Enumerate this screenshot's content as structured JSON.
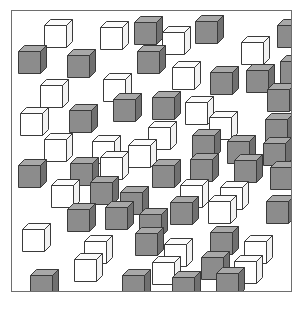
{
  "figure": {
    "title": "",
    "panel": {
      "x": 11,
      "y": 10,
      "width": 281,
      "height": 282,
      "border_color": "#6e6e6e",
      "background_color": "#ffffff"
    },
    "cube_style": {
      "size": 22,
      "depth": 6,
      "outline_color": "#3a3a3a",
      "gray_front": "#8c8c8c",
      "gray_top": "#a8a8a8",
      "gray_side": "#707070",
      "white_front": "#ffffff",
      "white_top": "#fbfbfb",
      "white_side": "#f2f2f2"
    },
    "counts": {
      "total": 61,
      "gray": 32,
      "white": 29
    }
  },
  "chart_data": {
    "type": "scatter",
    "title": "",
    "xlabel": "",
    "ylabel": "",
    "xlim": [
      0,
      281
    ],
    "ylim": [
      0,
      282
    ],
    "grid": false,
    "legend": [
      {
        "name": "gray cube",
        "color": "#8c8c8c"
      },
      {
        "name": "white cube",
        "color": "#ffffff"
      }
    ],
    "series": [
      {
        "name": "cubes",
        "points": [
          {
            "x": 32,
            "y": 8,
            "color": "white"
          },
          {
            "x": 88,
            "y": 10,
            "color": "white"
          },
          {
            "x": 122,
            "y": 5,
            "color": "gray"
          },
          {
            "x": 150,
            "y": 15,
            "color": "white"
          },
          {
            "x": 183,
            "y": 4,
            "color": "gray"
          },
          {
            "x": 229,
            "y": 25,
            "color": "white"
          },
          {
            "x": 265,
            "y": 8,
            "color": "gray"
          },
          {
            "x": 6,
            "y": 34,
            "color": "gray"
          },
          {
            "x": 55,
            "y": 38,
            "color": "gray"
          },
          {
            "x": 125,
            "y": 34,
            "color": "gray"
          },
          {
            "x": 160,
            "y": 50,
            "color": "white"
          },
          {
            "x": 198,
            "y": 55,
            "color": "gray"
          },
          {
            "x": 234,
            "y": 53,
            "color": "gray"
          },
          {
            "x": 268,
            "y": 44,
            "color": "gray"
          },
          {
            "x": 28,
            "y": 68,
            "color": "white"
          },
          {
            "x": 91,
            "y": 62,
            "color": "white"
          },
          {
            "x": 140,
            "y": 80,
            "color": "gray"
          },
          {
            "x": 173,
            "y": 85,
            "color": "white"
          },
          {
            "x": 255,
            "y": 72,
            "color": "gray"
          },
          {
            "x": 8,
            "y": 96,
            "color": "white"
          },
          {
            "x": 57,
            "y": 93,
            "color": "gray"
          },
          {
            "x": 101,
            "y": 82,
            "color": "gray"
          },
          {
            "x": 136,
            "y": 110,
            "color": "white"
          },
          {
            "x": 197,
            "y": 100,
            "color": "white"
          },
          {
            "x": 253,
            "y": 102,
            "color": "gray"
          },
          {
            "x": 32,
            "y": 122,
            "color": "white"
          },
          {
            "x": 80,
            "y": 124,
            "color": "white"
          },
          {
            "x": 116,
            "y": 128,
            "color": "white"
          },
          {
            "x": 180,
            "y": 118,
            "color": "gray"
          },
          {
            "x": 215,
            "y": 124,
            "color": "gray"
          },
          {
            "x": 251,
            "y": 126,
            "color": "gray"
          },
          {
            "x": 6,
            "y": 148,
            "color": "gray"
          },
          {
            "x": 58,
            "y": 146,
            "color": "gray"
          },
          {
            "x": 88,
            "y": 140,
            "color": "white"
          },
          {
            "x": 140,
            "y": 148,
            "color": "gray"
          },
          {
            "x": 178,
            "y": 142,
            "color": "gray"
          },
          {
            "x": 222,
            "y": 143,
            "color": "gray"
          },
          {
            "x": 258,
            "y": 150,
            "color": "gray"
          },
          {
            "x": 39,
            "y": 168,
            "color": "white"
          },
          {
            "x": 78,
            "y": 165,
            "color": "gray"
          },
          {
            "x": 108,
            "y": 175,
            "color": "gray"
          },
          {
            "x": 168,
            "y": 168,
            "color": "white"
          },
          {
            "x": 208,
            "y": 170,
            "color": "white"
          },
          {
            "x": 55,
            "y": 192,
            "color": "gray"
          },
          {
            "x": 93,
            "y": 190,
            "color": "gray"
          },
          {
            "x": 127,
            "y": 197,
            "color": "gray"
          },
          {
            "x": 158,
            "y": 185,
            "color": "gray"
          },
          {
            "x": 196,
            "y": 184,
            "color": "white"
          },
          {
            "x": 254,
            "y": 184,
            "color": "gray"
          },
          {
            "x": 10,
            "y": 212,
            "color": "white"
          },
          {
            "x": 72,
            "y": 224,
            "color": "white"
          },
          {
            "x": 123,
            "y": 216,
            "color": "gray"
          },
          {
            "x": 152,
            "y": 227,
            "color": "white"
          },
          {
            "x": 198,
            "y": 215,
            "color": "gray"
          },
          {
            "x": 232,
            "y": 224,
            "color": "white"
          },
          {
            "x": 62,
            "y": 242,
            "color": "white"
          },
          {
            "x": 140,
            "y": 245,
            "color": "white"
          },
          {
            "x": 189,
            "y": 240,
            "color": "gray"
          },
          {
            "x": 222,
            "y": 244,
            "color": "white"
          },
          {
            "x": 18,
            "y": 258,
            "color": "gray"
          },
          {
            "x": 110,
            "y": 258,
            "color": "gray"
          },
          {
            "x": 160,
            "y": 260,
            "color": "gray"
          },
          {
            "x": 204,
            "y": 256,
            "color": "gray"
          }
        ]
      }
    ]
  }
}
